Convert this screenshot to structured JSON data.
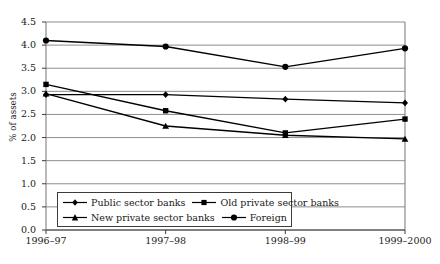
{
  "chart_data": {
    "type": "line",
    "title": "",
    "xlabel": "",
    "ylabel": "% of assets",
    "categories": [
      "1996–97",
      "1997–98",
      "1998–99",
      "1999–2000"
    ],
    "ylim": [
      0.0,
      4.5
    ],
    "yticks": [
      "0.0",
      "0.5",
      "1.0",
      "1.5",
      "2.0",
      "2.5",
      "3.0",
      "3.5",
      "4.0",
      "4.5"
    ],
    "grid": true,
    "legend_position": "inside-bottom-left",
    "series": [
      {
        "name": "Public sector banks",
        "marker": "diamond",
        "color": "#000000",
        "values": [
          2.93,
          2.93,
          2.83,
          2.75
        ]
      },
      {
        "name": "Old private sector banks",
        "marker": "square",
        "color": "#000000",
        "values": [
          3.15,
          2.58,
          2.1,
          2.4
        ]
      },
      {
        "name": "New private sector banks",
        "marker": "triangle",
        "color": "#000000",
        "values": [
          2.95,
          2.25,
          2.05,
          1.97
        ]
      },
      {
        "name": "Foreign",
        "marker": "circle",
        "color": "#000000",
        "values": [
          4.1,
          3.97,
          3.53,
          3.93
        ]
      }
    ]
  }
}
